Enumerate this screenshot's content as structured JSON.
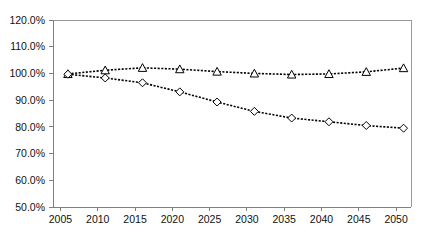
{
  "chart_data": {
    "type": "line",
    "title": "",
    "subtitle": "",
    "xlabel": "",
    "ylabel": "",
    "x": [
      2005,
      2010,
      2015,
      2020,
      2025,
      2030,
      2035,
      2040,
      2045,
      2050
    ],
    "xtick_labels": [
      "2005",
      "2010",
      "2015",
      "2020",
      "2025",
      "2030",
      "2035",
      "2040",
      "2045",
      "2050"
    ],
    "ytick_labels": [
      "120.0%",
      "110.0%",
      "100.0%",
      "90.0%",
      "80.0%",
      "70.0%",
      "60.0%",
      "50.0%"
    ],
    "ytick_values": [
      120.0,
      110.0,
      100.0,
      90.0,
      80.0,
      70.0,
      60.0,
      50.0
    ],
    "xlim": [
      2004,
      2052
    ],
    "ylim": [
      50.0,
      120.0
    ],
    "grid": false,
    "legend": "none",
    "y_unit": "%",
    "series": [
      {
        "name": "series-triangle",
        "marker": "triangle",
        "line_style": "dotted",
        "color": "#000000",
        "x": [
          2006,
          2011,
          2016,
          2021,
          2026,
          2031,
          2036,
          2041,
          2046,
          2051
        ],
        "values": [
          99.8,
          101.2,
          102.1,
          101.6,
          100.7,
          100.0,
          99.6,
          99.8,
          100.6,
          102.0
        ]
      },
      {
        "name": "series-diamond",
        "marker": "diamond",
        "line_style": "dotted",
        "color": "#000000",
        "x": [
          2006,
          2011,
          2016,
          2021,
          2026,
          2031,
          2036,
          2041,
          2046,
          2051
        ],
        "values": [
          99.7,
          98.3,
          96.5,
          93.1,
          89.3,
          85.8,
          83.3,
          81.9,
          80.5,
          79.5
        ]
      }
    ]
  },
  "layout": {
    "plot_left": 53,
    "plot_right": 411,
    "plot_top": 20,
    "plot_bottom": 207,
    "axis_color": "#808080",
    "border_color": "#9a9a9a",
    "series_color": "#000000",
    "background": "#ffffff"
  }
}
